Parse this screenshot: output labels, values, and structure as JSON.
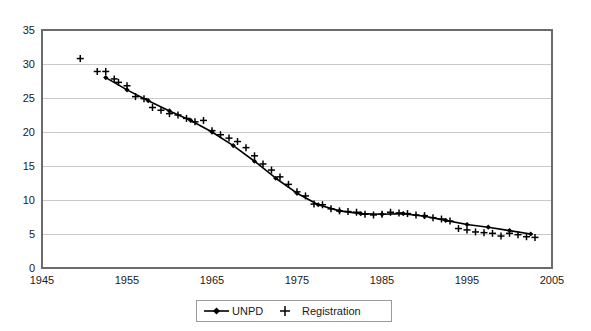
{
  "chart_data": {
    "type": "line",
    "title": "",
    "xlabel": "",
    "ylabel": "",
    "xlim": [
      1945,
      2005
    ],
    "ylim": [
      0,
      35
    ],
    "xticks": [
      1945,
      1955,
      1965,
      1975,
      1985,
      1995,
      2005
    ],
    "yticks": [
      0,
      5,
      10,
      15,
      20,
      25,
      30,
      35
    ],
    "grid": true,
    "legend_position": "bottom-center",
    "series": [
      {
        "name": "UNPD",
        "marker": "diamond",
        "line": true,
        "x": [
          1952.5,
          1955,
          1957.5,
          1960,
          1962.5,
          1965,
          1967.5,
          1970,
          1972.5,
          1975,
          1977.5,
          1980,
          1982.5,
          1985,
          1987.5,
          1990,
          1992.5,
          1995,
          1997.5,
          2000,
          2002.5
        ],
        "values": [
          28.0,
          26.2,
          24.6,
          23.1,
          21.7,
          20.0,
          18.0,
          15.7,
          13.2,
          11.0,
          9.3,
          8.4,
          8.0,
          7.9,
          8.0,
          7.6,
          7.0,
          6.4,
          6.0,
          5.5,
          5.0
        ]
      },
      {
        "name": "Registration",
        "marker": "plus",
        "line": false,
        "x": [
          1949.5,
          1951.5,
          1952.5,
          1953.5,
          1954,
          1955,
          1956,
          1957,
          1958,
          1959,
          1960,
          1961,
          1962,
          1963,
          1964,
          1965,
          1966,
          1967,
          1968,
          1969,
          1970,
          1971,
          1972,
          1973,
          1974,
          1975,
          1976,
          1977,
          1978,
          1979,
          1980,
          1981,
          1982,
          1983,
          1984,
          1985,
          1986,
          1987,
          1988,
          1989,
          1990,
          1991,
          1992,
          1993,
          1994,
          1995,
          1996,
          1997,
          1998,
          1999,
          2000,
          2001,
          2002,
          2003
        ],
        "values": [
          30.8,
          28.9,
          28.9,
          27.8,
          27.3,
          26.8,
          25.2,
          24.9,
          23.6,
          23.2,
          22.7,
          22.5,
          22.0,
          21.5,
          21.7,
          20.2,
          19.6,
          19.1,
          18.6,
          17.7,
          16.5,
          15.3,
          14.4,
          13.4,
          12.3,
          11.2,
          10.6,
          9.4,
          9.3,
          8.7,
          8.4,
          8.3,
          8.2,
          7.9,
          7.8,
          7.9,
          8.2,
          8.1,
          8.0,
          7.8,
          7.7,
          7.4,
          7.2,
          6.9,
          5.8,
          5.6,
          5.3,
          5.2,
          5.1,
          4.7,
          5.1,
          4.9,
          4.6,
          4.5
        ]
      }
    ],
    "colors": {
      "line": "#000000",
      "marker": "#000000",
      "grid": "#c9c9c9",
      "frame": "#6b6b6b",
      "background": "#ffffff"
    }
  },
  "legend": {
    "items": [
      {
        "label": "UNPD"
      },
      {
        "label": "Registration"
      }
    ]
  }
}
